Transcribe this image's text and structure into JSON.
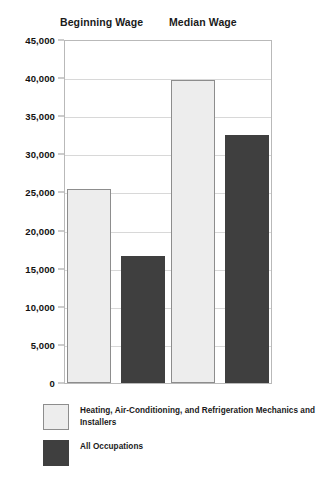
{
  "chart_data": {
    "type": "bar",
    "title": "",
    "xlabel": "",
    "ylabel": "",
    "categories": [
      "Beginning Wage",
      "Median Wage"
    ],
    "series": [
      {
        "name": "Heating, Air-Conditioning, and Refrigeration Mechanics and Installers",
        "color": "#ededed",
        "values": [
          25400,
          39800
        ]
      },
      {
        "name": "All Occupations",
        "color": "#3f3f3f",
        "values": [
          16700,
          32600
        ]
      }
    ],
    "ylim": [
      0,
      45000
    ],
    "ytick_values": [
      45000,
      40000,
      35000,
      30000,
      25000,
      20000,
      15000,
      10000,
      5000,
      0
    ],
    "ytick_labels": [
      "45,000",
      "40,000",
      "35,000",
      "30,000",
      "25,000",
      "20,000",
      "15,000",
      "10,000",
      "5,000",
      "0"
    ],
    "grid": true,
    "legend_position": "bottom-left"
  },
  "headers": [
    {
      "label": "Beginning Wage"
    },
    {
      "label": "Median Wage"
    }
  ],
  "legend": [
    {
      "label": "Heating, Air-Conditioning, and Refrigeration Mechanics and Installers"
    },
    {
      "label": "All Occupations"
    }
  ]
}
